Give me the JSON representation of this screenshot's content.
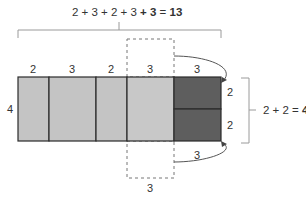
{
  "diagram": {
    "top_equation": {
      "terms": "2 + 3 + 2 + 3 ",
      "added": "+ 3",
      "equals": " = ",
      "result": "13"
    },
    "right_equation": {
      "terms": "2 + 2",
      "equals": " = ",
      "result": "4"
    },
    "left_height_label": "4",
    "column_labels": [
      "2",
      "3",
      "2",
      "3",
      "3"
    ],
    "dark_block_labels": [
      "2",
      "2"
    ],
    "bottom_moved_label": "3",
    "bottom_dashed_label": "3",
    "colors": {
      "light_fill": "#c4c4c4",
      "dark_fill": "#5e5e5e",
      "stroke": "#2b2b2b",
      "bracket": "#9a9a9a"
    }
  }
}
